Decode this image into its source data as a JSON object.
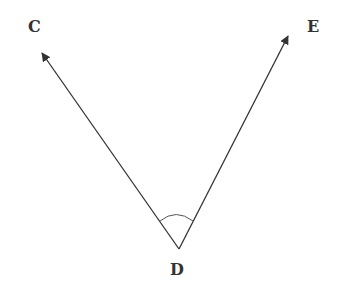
{
  "diagram": {
    "type": "angle",
    "vertex": {
      "label": "D",
      "x": 179,
      "y": 249
    },
    "rays": [
      {
        "name": "ray-DC",
        "to_label": "C",
        "tip": {
          "x": 42,
          "y": 53
        }
      },
      {
        "name": "ray-DE",
        "to_label": "E",
        "tip": {
          "x": 288,
          "y": 36
        }
      }
    ],
    "angle_mark": {
      "from": {
        "x": 160,
        "y": 221
      },
      "to": {
        "x": 193,
        "y": 221
      },
      "control": {
        "x": 176,
        "y": 208
      }
    },
    "labels": {
      "C": {
        "text": "C",
        "x": 28,
        "y": 19
      },
      "E": {
        "text": "E",
        "x": 307,
        "y": 19
      },
      "D": {
        "text": "D",
        "x": 170,
        "y": 262
      }
    },
    "colors": {
      "line": "#333333",
      "arc": "#555555",
      "label": "#333333"
    }
  }
}
